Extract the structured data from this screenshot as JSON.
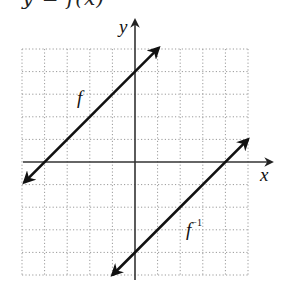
{
  "header": {
    "cutoff_text": "y = f(x)"
  },
  "axes": {
    "x_label": "x",
    "y_label": "y"
  },
  "curves": {
    "f_label": "f",
    "finv_label_base": "f",
    "finv_label_sup": "−1"
  },
  "colors": {
    "line": "#111111",
    "grid": "#9a9a9a",
    "axis": "#333333"
  },
  "chart_data": {
    "type": "line",
    "title": "",
    "xlabel": "x",
    "ylabel": "y",
    "xlim": [
      -5,
      5
    ],
    "ylim": [
      -5,
      5
    ],
    "grid": true,
    "grid_style": "dotted",
    "grid_step": 1,
    "series": [
      {
        "name": "f",
        "equation": "y = x + 4",
        "x": [
          -4.9,
          -4,
          0,
          1.05
        ],
        "y": [
          -0.9,
          0,
          4,
          5.05
        ],
        "arrows": "both"
      },
      {
        "name": "f^-1",
        "equation": "y = x - 4",
        "x": [
          -1.0,
          0,
          4,
          5.0
        ],
        "y": [
          -5.0,
          -4,
          0,
          1.0
        ],
        "arrows": "both"
      }
    ],
    "annotations": [
      {
        "text": "f",
        "x": -2.3,
        "y": 2.8
      },
      {
        "text": "f^-1",
        "x": 2.5,
        "y": -3.0
      }
    ]
  }
}
